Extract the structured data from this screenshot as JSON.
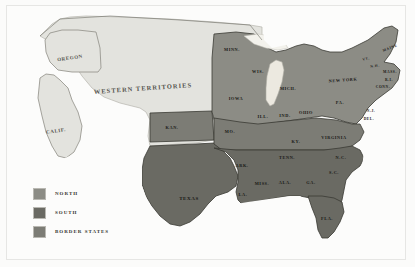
{
  "figure": {
    "background_color": "#fbfbfa",
    "frame_color": "#e6e6e4"
  },
  "palette": {
    "north": "#8c8c85",
    "south": "#6a6a63",
    "border_states": "#7c7c75",
    "territory": "#e3e3de",
    "water": "#ffffff",
    "lake": "#ece9e0",
    "outline": "#3a3a34"
  },
  "legend": {
    "items": [
      {
        "label": "NORTH",
        "color": "#8c8c85",
        "group": "north"
      },
      {
        "label": "SOUTH",
        "color": "#6a6a63",
        "group": "south"
      },
      {
        "label": "BORDER STATES",
        "color": "#7c7c75",
        "group": "border"
      }
    ]
  },
  "regions": [
    {
      "name": "WESTERN TERRITORIES",
      "group": "territory",
      "x": 143,
      "y": 88,
      "size": "lbl-xl",
      "tone": "on-light",
      "rotate": -4
    },
    {
      "name": "OREGON",
      "group": "territory",
      "x": 70,
      "y": 58,
      "size": "lbl-md",
      "tone": "on-light",
      "rotate": -8
    },
    {
      "name": "CALIF.",
      "group": "territory",
      "x": 56,
      "y": 131,
      "size": "lbl-md",
      "tone": "on-light",
      "rotate": -8
    }
  ],
  "states": [
    {
      "name": "MINN.",
      "group": "north",
      "x": 232,
      "y": 49,
      "size": "lbl-sm",
      "tone": "on-dark",
      "rotate": 0
    },
    {
      "name": "WIS.",
      "group": "north",
      "x": 258,
      "y": 71,
      "size": "lbl-sm",
      "tone": "on-dark",
      "rotate": 0
    },
    {
      "name": "MICH.",
      "group": "north",
      "x": 288,
      "y": 88,
      "size": "lbl-sm",
      "tone": "on-dark",
      "rotate": 0
    },
    {
      "name": "IOWA",
      "group": "north",
      "x": 236,
      "y": 98,
      "size": "lbl-sm",
      "tone": "on-dark",
      "rotate": 0
    },
    {
      "name": "ILL.",
      "group": "north",
      "x": 263,
      "y": 116,
      "size": "lbl-sm",
      "tone": "on-dark",
      "rotate": 0
    },
    {
      "name": "IND.",
      "group": "north",
      "x": 285,
      "y": 115,
      "size": "lbl-sm",
      "tone": "on-dark",
      "rotate": 0
    },
    {
      "name": "OHIO",
      "group": "north",
      "x": 306,
      "y": 112,
      "size": "lbl-sm",
      "tone": "on-dark",
      "rotate": 0
    },
    {
      "name": "PA.",
      "group": "north",
      "x": 340,
      "y": 102,
      "size": "lbl-sm",
      "tone": "on-dark",
      "rotate": 0
    },
    {
      "name": "NEW YORK",
      "group": "north",
      "x": 343,
      "y": 80,
      "size": "lbl-sm",
      "tone": "on-dark",
      "rotate": -4
    },
    {
      "name": "MAINE",
      "group": "north",
      "x": 390,
      "y": 48,
      "size": "lbl-xs",
      "tone": "on-dark",
      "rotate": -22
    },
    {
      "name": "VT.",
      "group": "north",
      "x": 366,
      "y": 59,
      "size": "lbl-xs",
      "tone": "on-dark",
      "rotate": -14
    },
    {
      "name": "N.H.",
      "group": "north",
      "x": 375,
      "y": 66,
      "size": "lbl-xs",
      "tone": "on-dark",
      "rotate": -10
    },
    {
      "name": "MASS.",
      "group": "north",
      "x": 390,
      "y": 72,
      "size": "lbl-xs",
      "tone": "on-dark",
      "rotate": 0
    },
    {
      "name": "R.I.",
      "group": "north",
      "x": 389,
      "y": 80,
      "size": "lbl-xs",
      "tone": "on-dark",
      "rotate": 0
    },
    {
      "name": "CONN.",
      "group": "north",
      "x": 383,
      "y": 87,
      "size": "lbl-xs",
      "tone": "on-dark",
      "rotate": 0
    },
    {
      "name": "N.J.",
      "group": "north",
      "x": 371,
      "y": 111,
      "size": "lbl-xs",
      "tone": "on-dark",
      "rotate": 0
    },
    {
      "name": "DEL.",
      "group": "north",
      "x": 369,
      "y": 119,
      "size": "lbl-xs",
      "tone": "on-dark",
      "rotate": 0
    },
    {
      "name": "KAN.",
      "group": "border",
      "x": 172,
      "y": 127,
      "size": "lbl-sm",
      "tone": "on-dark",
      "rotate": 0
    },
    {
      "name": "MO.",
      "group": "border",
      "x": 230,
      "y": 131,
      "size": "lbl-sm",
      "tone": "on-dark",
      "rotate": 0
    },
    {
      "name": "KY.",
      "group": "border",
      "x": 296,
      "y": 141,
      "size": "lbl-sm",
      "tone": "on-dark",
      "rotate": 0
    },
    {
      "name": "VIRGINIA",
      "group": "border",
      "x": 334,
      "y": 137,
      "size": "lbl-sm",
      "tone": "on-dark",
      "rotate": 0
    },
    {
      "name": "ARK.",
      "group": "south",
      "x": 242,
      "y": 165,
      "size": "lbl-sm",
      "tone": "on-dark",
      "rotate": 0
    },
    {
      "name": "TENN.",
      "group": "south",
      "x": 287,
      "y": 157,
      "size": "lbl-sm",
      "tone": "on-dark",
      "rotate": 0
    },
    {
      "name": "N.C.",
      "group": "south",
      "x": 341,
      "y": 157,
      "size": "lbl-sm",
      "tone": "on-dark",
      "rotate": 0
    },
    {
      "name": "S.C.",
      "group": "south",
      "x": 334,
      "y": 172,
      "size": "lbl-sm",
      "tone": "on-dark",
      "rotate": 0
    },
    {
      "name": "MISS.",
      "group": "south",
      "x": 262,
      "y": 183,
      "size": "lbl-sm",
      "tone": "on-dark",
      "rotate": 0
    },
    {
      "name": "ALA.",
      "group": "south",
      "x": 285,
      "y": 182,
      "size": "lbl-sm",
      "tone": "on-dark",
      "rotate": 0
    },
    {
      "name": "GA.",
      "group": "south",
      "x": 311,
      "y": 182,
      "size": "lbl-sm",
      "tone": "on-dark",
      "rotate": 0
    },
    {
      "name": "LA.",
      "group": "south",
      "x": 243,
      "y": 194,
      "size": "lbl-sm",
      "tone": "on-dark",
      "rotate": 0
    },
    {
      "name": "TEXAS",
      "group": "south",
      "x": 189,
      "y": 198,
      "size": "lbl-md",
      "tone": "on-dark",
      "rotate": 0
    },
    {
      "name": "FLA.",
      "group": "south",
      "x": 327,
      "y": 218,
      "size": "lbl-sm",
      "tone": "on-dark",
      "rotate": 0
    }
  ]
}
